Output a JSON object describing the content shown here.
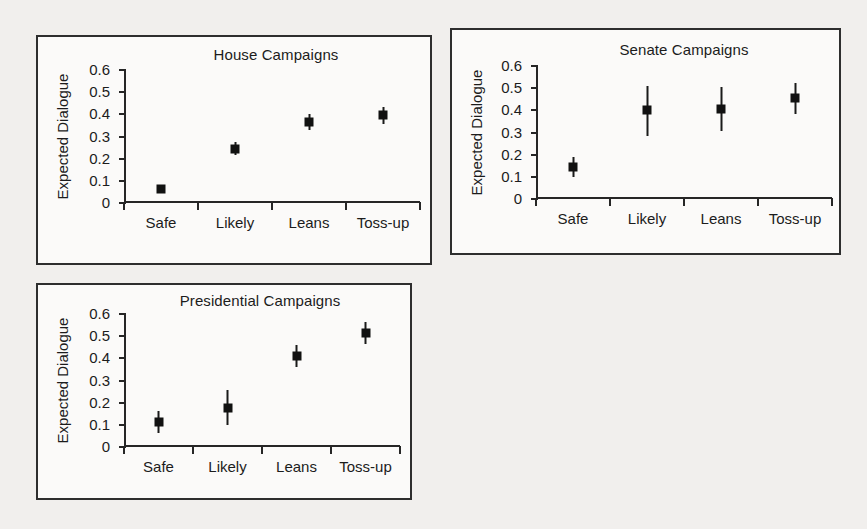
{
  "figure": {
    "background_color": "#f1efed",
    "panel_background_color": "#fbfaf9",
    "ink_color": "#1c1c1c",
    "marker_color": "#111111"
  },
  "chart_data": [
    {
      "id": "house",
      "type": "scatter",
      "title": "House Campaigns",
      "xlabel": "",
      "ylabel": "Expected Dialogue",
      "categories": [
        "Safe",
        "Likely",
        "Leans",
        "Toss-up"
      ],
      "values": [
        0.065,
        0.245,
        0.365,
        0.395
      ],
      "err_low": [
        0.05,
        0.215,
        0.33,
        0.355
      ],
      "err_high": [
        0.08,
        0.275,
        0.4,
        0.435
      ],
      "yticks": [
        "0",
        "0.1",
        "0.2",
        "0.3",
        "0.4",
        "0.5",
        "0.6"
      ],
      "ytickvals": [
        0,
        0.1,
        0.2,
        0.3,
        0.4,
        0.5,
        0.6
      ],
      "ylim": [
        0,
        0.6
      ],
      "grid": false,
      "legend": "none"
    },
    {
      "id": "senate",
      "type": "scatter",
      "title": "Senate Campaigns",
      "xlabel": "",
      "ylabel": "Expected Dialogue",
      "categories": [
        "Safe",
        "Likely",
        "Leans",
        "Toss-up"
      ],
      "values": [
        0.145,
        0.4,
        0.405,
        0.455
      ],
      "err_low": [
        0.1,
        0.285,
        0.305,
        0.385
      ],
      "err_high": [
        0.19,
        0.51,
        0.505,
        0.525
      ],
      "yticks": [
        "0",
        "0.1",
        "0.2",
        "0.3",
        "0.4",
        "0.5",
        "0.6"
      ],
      "ytickvals": [
        0,
        0.1,
        0.2,
        0.3,
        0.4,
        0.5,
        0.6
      ],
      "ylim": [
        0,
        0.6
      ],
      "grid": false,
      "legend": "none"
    },
    {
      "id": "presidential",
      "type": "scatter",
      "title": "Presidential Campaigns",
      "xlabel": "",
      "ylabel": "Expected Dialogue",
      "categories": [
        "Safe",
        "Likely",
        "Leans",
        "Toss-up"
      ],
      "values": [
        0.112,
        0.178,
        0.412,
        0.515
      ],
      "err_low": [
        0.062,
        0.098,
        0.362,
        0.465
      ],
      "err_high": [
        0.162,
        0.258,
        0.462,
        0.565
      ],
      "yticks": [
        "0",
        "0.1",
        "0.2",
        "0.3",
        "0.4",
        "0.5",
        "0.6"
      ],
      "ytickvals": [
        0,
        0.1,
        0.2,
        0.3,
        0.4,
        0.5,
        0.6
      ],
      "ylim": [
        0,
        0.6
      ],
      "grid": false,
      "legend": "none"
    }
  ],
  "panels": {
    "house": {
      "x": 36,
      "y": 35,
      "w": 396,
      "h": 230
    },
    "senate": {
      "x": 450,
      "y": 28,
      "w": 391,
      "h": 227
    },
    "presidential": {
      "x": 36,
      "y": 283,
      "w": 376,
      "h": 217
    }
  },
  "plots": {
    "house": {
      "x": 86,
      "y": 33,
      "w": 296,
      "h": 133
    },
    "senate": {
      "x": 84,
      "y": 36,
      "w": 296,
      "h": 133
    },
    "presidential": {
      "x": 86,
      "y": 29,
      "w": 276,
      "h": 133
    }
  },
  "titles": {
    "house": {
      "x": 90,
      "y": 9,
      "w": 296
    },
    "senate": {
      "x": 84,
      "y": 11,
      "w": 296
    },
    "presidential": {
      "x": 74,
      "y": 7,
      "w": 296
    }
  },
  "ylabels": {
    "house": {
      "cx": 24,
      "cy": 100
    },
    "senate": {
      "cx": 24,
      "cy": 103
    },
    "presidential": {
      "cx": 24,
      "cy": 96
    }
  }
}
